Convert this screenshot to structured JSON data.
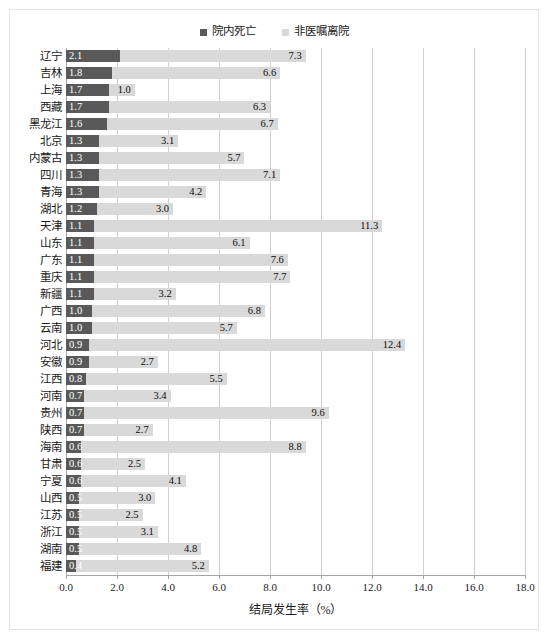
{
  "legend": {
    "items": [
      {
        "label": "院内死亡",
        "color": "#595959",
        "key": "in_hospital_death"
      },
      {
        "label": "非医嘱离院",
        "color": "#d9d9d9",
        "key": "discharge_against_advice"
      }
    ]
  },
  "axis": {
    "x_title": "结局发生率（%）",
    "x_ticks": [
      "0.0",
      "2.0",
      "4.0",
      "6.0",
      "8.0",
      "10.0",
      "12.0",
      "14.0",
      "16.0",
      "18.0"
    ],
    "x_min": 0.0,
    "x_max": 18.0,
    "x_step": 2.0
  },
  "chart_data": {
    "type": "bar",
    "orientation": "horizontal",
    "stacked": true,
    "title": "",
    "subtitle": "",
    "xlabel": "结局发生率（%）",
    "ylabel": "",
    "xlim": [
      0.0,
      18.0
    ],
    "xticks": [
      0.0,
      2.0,
      4.0,
      6.0,
      8.0,
      10.0,
      12.0,
      14.0,
      16.0,
      18.0
    ],
    "grid": "vertical",
    "legend_position": "top-center",
    "categories": [
      "辽宁",
      "吉林",
      "上海",
      "西藏",
      "黑龙江",
      "北京",
      "内蒙古",
      "四川",
      "青海",
      "湖北",
      "天津",
      "山东",
      "广东",
      "重庆",
      "新疆",
      "广西",
      "云南",
      "河北",
      "安徽",
      "江西",
      "河南",
      "贵州",
      "陕西",
      "海南",
      "甘肃",
      "宁夏",
      "山西",
      "江苏",
      "浙江",
      "湖南",
      "福建"
    ],
    "series": [
      {
        "name": "院内死亡",
        "color": "#595959",
        "values": [
          2.1,
          1.8,
          1.7,
          1.7,
          1.6,
          1.3,
          1.3,
          1.3,
          1.3,
          1.2,
          1.1,
          1.1,
          1.1,
          1.1,
          1.1,
          1.0,
          1.0,
          0.9,
          0.9,
          0.8,
          0.7,
          0.7,
          0.7,
          0.6,
          0.6,
          0.6,
          0.5,
          0.5,
          0.5,
          0.5,
          0.4
        ]
      },
      {
        "name": "非医嘱离院",
        "color": "#d9d9d9",
        "values": [
          7.3,
          6.6,
          1.0,
          6.3,
          6.7,
          3.1,
          5.7,
          7.1,
          4.2,
          3.0,
          11.3,
          6.1,
          7.6,
          7.7,
          3.2,
          6.8,
          5.7,
          12.4,
          2.7,
          5.5,
          3.4,
          9.6,
          2.7,
          8.8,
          2.5,
          4.1,
          3.0,
          2.5,
          3.1,
          4.8,
          5.2
        ]
      }
    ]
  }
}
